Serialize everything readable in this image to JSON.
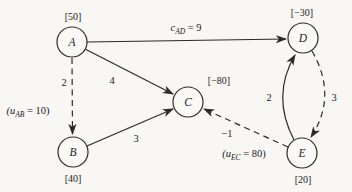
{
  "figure": {
    "colors": {
      "background": "#f8f7f4",
      "ink": "#2b2b2b",
      "node_fill": "#faf9f6"
    },
    "nodes": {
      "a": {
        "label": "A",
        "value": "[50]"
      },
      "b": {
        "label": "B",
        "value": "[40]"
      },
      "c": {
        "label": "C",
        "value": "[−80]"
      },
      "d": {
        "label": "D",
        "value": "[−30]"
      },
      "e": {
        "label": "E",
        "value": "[20]"
      }
    },
    "edges": {
      "ad": {
        "var": "c",
        "sub": "AD",
        "rest": " = 9"
      },
      "ac": {
        "cost": "4"
      },
      "ab": {
        "cost": "2",
        "bound_open": "(u",
        "bound_sub": "AB",
        "bound_rest": " = 10)"
      },
      "bc": {
        "cost": "3"
      },
      "ec": {
        "cost": "−1",
        "bound_open": "(u",
        "bound_sub": "EC",
        "bound_rest": " = 80)"
      },
      "ed": {
        "cost": "2"
      },
      "de": {
        "cost": "3"
      }
    }
  }
}
